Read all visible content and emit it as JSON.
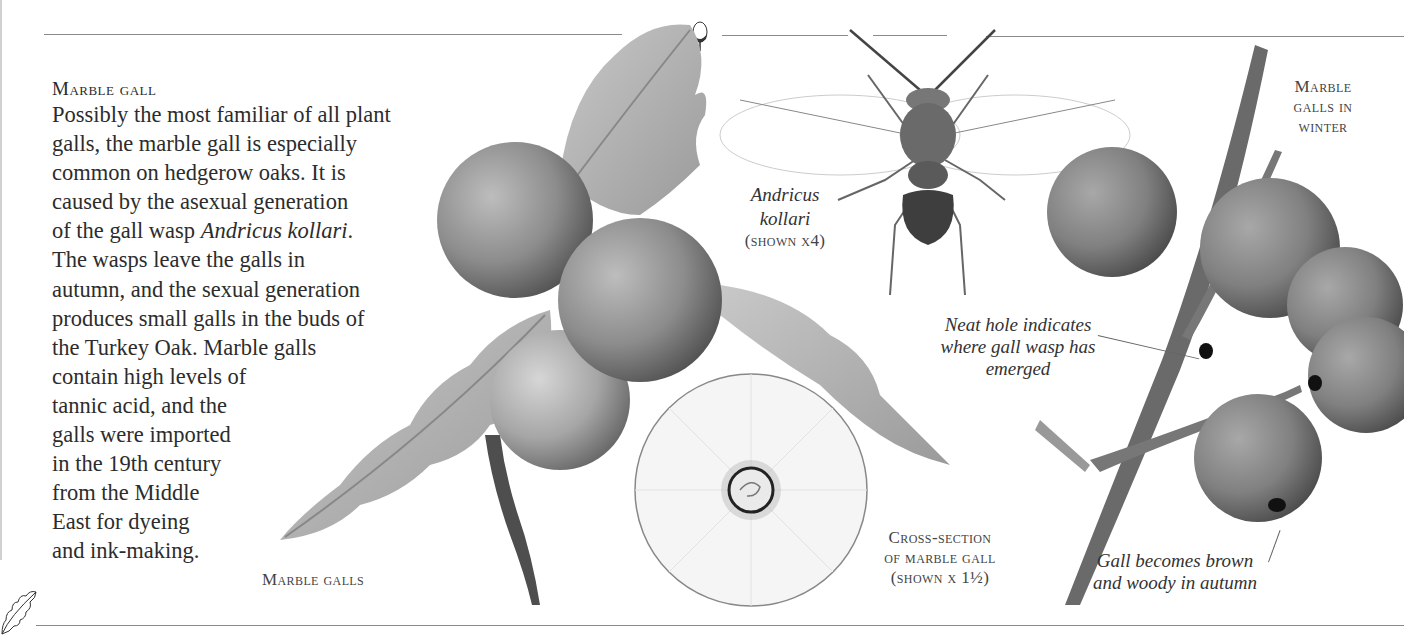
{
  "article": {
    "heading": "Marble gall",
    "body_lines": [
      "Possibly the most familiar of all plant",
      "galls, the marble gall is especially",
      "common on hedgerow oaks. It is",
      "caused by the asexual generation",
      "of the gall wasp ",
      "The wasps leave the galls in",
      "autumn, and the sexual generation",
      "produces small galls in the buds of",
      "the Turkey Oak. Marble galls",
      "contain high levels of",
      "tannic acid, and the",
      "galls were imported",
      "in the 19th century",
      "from the Middle",
      "East for dyeing",
      "and ink-making."
    ],
    "species_italic": "Andricus kollari",
    "species_suffix": "."
  },
  "illustrations": {
    "marble_galls": {
      "caption": "Marble galls"
    },
    "wasp": {
      "name_line1": "Andricus",
      "name_line2": "kollari",
      "scale": "(shown x4)"
    },
    "cross_section": {
      "line1": "Cross-section",
      "line2": "of marble gall",
      "line3": "(shown x 1½)"
    },
    "winter_galls": {
      "line1": "Marble",
      "line2": "galls in",
      "line3": "winter"
    },
    "annotations": {
      "hole_line1": "Neat hole indicates",
      "hole_line2": "where gall wasp has",
      "hole_line3": "emerged",
      "woody_line1": "Gall becomes brown",
      "woody_line2": "and woody in autumn"
    }
  },
  "decorations": {
    "top_icon": "acorn-icon",
    "bottom_icon": "oak-leaf-icon"
  },
  "colors": {
    "rule": "#8a8a8a",
    "text": "#2c2c2c",
    "gall_grey": "#8c8c8c",
    "paper": "#ffffff"
  }
}
